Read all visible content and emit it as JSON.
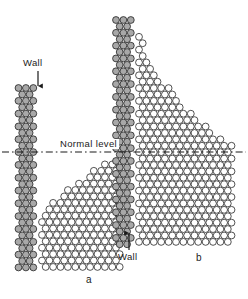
{
  "figure": {
    "panels": [
      {
        "id": "a",
        "caption_label": "a",
        "description": "Non-wetting liquid: surface depressed below normal level near the wall",
        "wall_label": "Wall",
        "wall_arrow_direction": "down"
      },
      {
        "id": "b",
        "caption_label": "b",
        "description": "Wetting liquid: surface raised above normal level, climbing the wall",
        "wall_label": "Wall",
        "wall_arrow_direction": "up"
      }
    ],
    "normal_level_label": "Normal level",
    "colors": {
      "wall_molecule_fill": "#a8a8a8",
      "liquid_molecule_fill": "#ffffff",
      "molecule_outline": "#1a1a1a",
      "reference_line": "#1a1a1a",
      "background": "#ffffff",
      "text": "#1b1b1b"
    },
    "geometry": {
      "molecule_diameter_px": 7.4,
      "normal_level_y_px": 152,
      "panel_a_wall_columns": 3,
      "panel_b_wall_columns": 3
    }
  },
  "chart_data": {
    "type": "diagram",
    "xlabel": "",
    "ylabel": "",
    "annotations": [
      "Wall",
      "Normal level",
      "Wall",
      "a",
      "b"
    ],
    "series": [
      {
        "name": "wall molecules (panel a)",
        "fill": "#a8a8a8"
      },
      {
        "name": "liquid molecules (panel a)",
        "fill": "#ffffff"
      },
      {
        "name": "wall molecules (panel b)",
        "fill": "#a8a8a8"
      },
      {
        "name": "liquid molecules (panel b)",
        "fill": "#ffffff"
      }
    ]
  }
}
